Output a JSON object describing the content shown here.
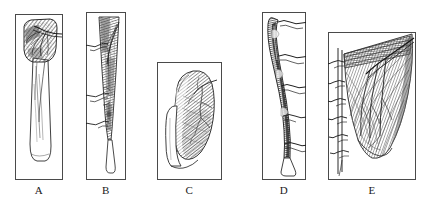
{
  "figure": {
    "background_color": "#ffffff",
    "ink_color": "#2b2b2b",
    "frame_color": "#4a4a4a",
    "panel_count": 5,
    "panels": [
      {
        "id": "A",
        "label": "A",
        "subject": "tapered muscle belly with tendon and branching nerve at proximal end",
        "x": 15,
        "y": 14,
        "width": 48,
        "height": 166
      },
      {
        "id": "B",
        "label": "B",
        "subject": "elongated narrow muscle with three levels of nerve branches exiting left",
        "x": 86,
        "y": 12,
        "width": 40,
        "height": 168
      },
      {
        "id": "C",
        "label": "C",
        "subject": "broad rounded hatched muscle mass with fine vascular branching",
        "x": 157,
        "y": 62,
        "width": 65,
        "height": 118
      },
      {
        "id": "D",
        "label": "D",
        "subject": "dark curved nerve trunk with five lateral branches exiting right",
        "x": 262,
        "y": 12,
        "width": 44,
        "height": 168
      },
      {
        "id": "E",
        "label": "E",
        "subject": "fan-shaped muscle sheet with spinal column and segmental nerve rootlets",
        "x": 328,
        "y": 32,
        "width": 88,
        "height": 148
      }
    ]
  }
}
